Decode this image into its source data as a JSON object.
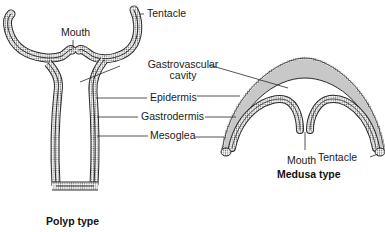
{
  "diagram": {
    "forms": [
      {
        "id": "polyp",
        "title": "Polyp type"
      },
      {
        "id": "medusa",
        "title": "Medusa type"
      }
    ],
    "labels": {
      "polyp_mouth": "Mouth",
      "polyp_tentacle": "Tentacle",
      "gastrovascular_line1": "Gastrovascular",
      "gastrovascular_line2": "cavity",
      "epidermis": "Epidermis",
      "gastrodermis": "Gastrodermis",
      "mesoglea": "Mesoglea",
      "medusa_mouth": "Mouth",
      "medusa_tentacle": "Tentacle"
    },
    "colors": {
      "outline": "#2a2a2a",
      "mesoglea_fill": "#c8c8c8",
      "dots": "#6a6a6a",
      "background": "#ffffff"
    }
  }
}
